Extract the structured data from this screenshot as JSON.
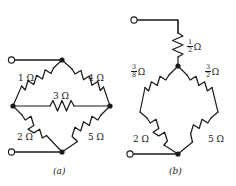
{
  "figure": {
    "line_color": "#1a1a1a",
    "background": "#ffffff"
  },
  "circuits": [
    {
      "id": "a",
      "caption": "(a)",
      "terminals": [
        "top-left open terminal",
        "bottom-left open terminal"
      ],
      "resistors": [
        {
          "name": "r1",
          "value": "1",
          "unit": "Ω",
          "label": "1 Ω",
          "is_fraction": false
        },
        {
          "name": "r4",
          "value": "4",
          "unit": "Ω",
          "label": "4 Ω",
          "is_fraction": false
        },
        {
          "name": "r3",
          "value": "3",
          "unit": "Ω",
          "label": "3 Ω",
          "is_fraction": false
        },
        {
          "name": "r2",
          "value": "2",
          "unit": "Ω",
          "label": "2 Ω",
          "is_fraction": false
        },
        {
          "name": "r5",
          "value": "5",
          "unit": "Ω",
          "label": "5 Ω",
          "is_fraction": false
        }
      ]
    },
    {
      "id": "b",
      "caption": "(b)",
      "terminals": [
        "top-left open terminal",
        "bottom-left open terminal"
      ],
      "resistors": [
        {
          "name": "r_half",
          "numerator": "1",
          "denominator": "2",
          "unit": "Ω",
          "label": "1/2 Ω",
          "is_fraction": true
        },
        {
          "name": "r_three_eighths",
          "numerator": "3",
          "denominator": "8",
          "unit": "Ω",
          "label": "3/8 Ω",
          "is_fraction": true
        },
        {
          "name": "r_three_halves",
          "numerator": "3",
          "denominator": "2",
          "unit": "Ω",
          "label": "3/2 Ω",
          "is_fraction": true
        },
        {
          "name": "r2",
          "value": "2",
          "unit": "Ω",
          "label": "2 Ω",
          "is_fraction": false
        },
        {
          "name": "r5",
          "value": "5",
          "unit": "Ω",
          "label": "5 Ω",
          "is_fraction": false
        }
      ]
    }
  ],
  "labels": {
    "a_1ohm": "1 Ω",
    "a_4ohm": "4 Ω",
    "a_3ohm": "3 Ω",
    "a_2ohm": "2 Ω",
    "a_5ohm": "5 Ω",
    "a_caption": "(a)",
    "b_half_num": "1",
    "b_half_den": "2",
    "b_half_unit": "Ω",
    "b_38_num": "3",
    "b_38_den": "8",
    "b_38_unit": "Ω",
    "b_32_num": "3",
    "b_32_den": "2",
    "b_32_unit": "Ω",
    "b_2ohm": "2 Ω",
    "b_5ohm": "5 Ω",
    "b_caption": "(b)"
  }
}
